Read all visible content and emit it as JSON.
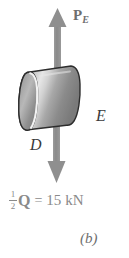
{
  "figure": {
    "caption": "(b)",
    "background_color": "#ffffff",
    "force_color": "#8a8a8a",
    "body_color": "#9a9a9a",
    "outline_color": "#2b2b2b",
    "label_color": "#6e6e6e",
    "point_label_color": "#3a3a3a",
    "type": "free-body-diagram"
  },
  "labels": {
    "upper_force": {
      "symbol": "P",
      "subscript": "E"
    },
    "point_E": "E",
    "point_D": "D"
  },
  "equation": {
    "fraction_numerator": "1",
    "fraction_denominator": "2",
    "quantity": "Q",
    "operator": "=",
    "value": "15",
    "unit": "kN",
    "full_text": "1/2 Q = 15 kN"
  },
  "arrows": {
    "up": {
      "direction": "up",
      "tip_y": 8,
      "tail_y": 70,
      "x": 58,
      "label": "P_E"
    },
    "down": {
      "direction": "down",
      "tip_y": 182,
      "tail_y": 120,
      "x": 57,
      "label": "1/2 Q = 15 kN"
    }
  },
  "icons": {
    "cylinder": "cylinder-shape",
    "arrow_up": "arrow-up-icon",
    "arrow_down": "arrow-down-icon"
  }
}
